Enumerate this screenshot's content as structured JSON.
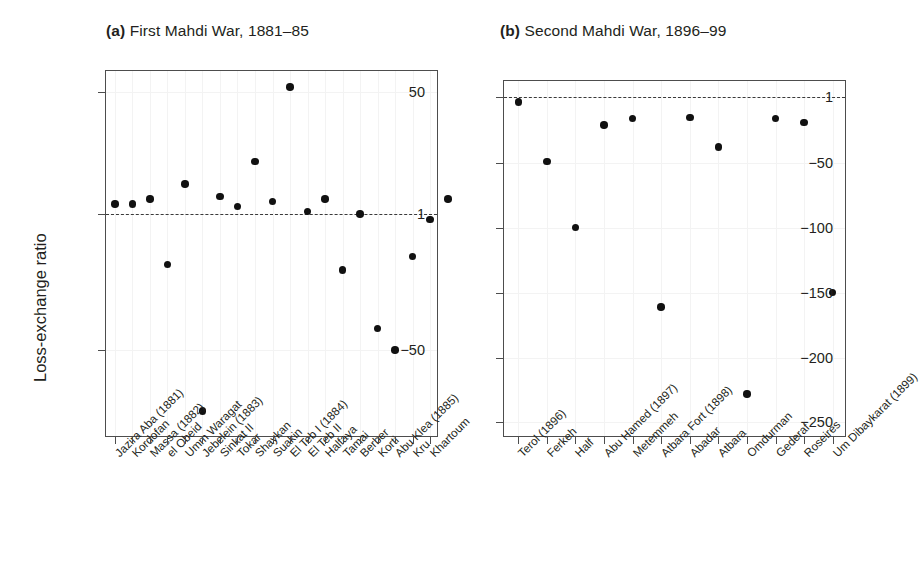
{
  "figure": {
    "y_axis_title": "Loss-exchange ratio",
    "background_color": "#ffffff",
    "point_color": "#111111",
    "axis_color": "#4d4d4d",
    "refline_color": "#3a3a3a"
  },
  "panels": {
    "a": {
      "tag": "(a)",
      "title": "First Mahdi War, 1881–85"
    },
    "b": {
      "tag": "(b)",
      "title": "Second Mahdi War, 1896–99"
    }
  },
  "chart_data": [
    {
      "type": "scatter",
      "panel": "a",
      "title": "(a) First Mahdi War, 1881–85",
      "xlabel": "",
      "ylabel": "Loss-exchange ratio",
      "ytick_labels": [
        "50",
        "1",
        "−50"
      ],
      "ytick_values": [
        50,
        1,
        -50
      ],
      "ylim": [
        -115,
        62
      ],
      "grid": true,
      "legend": "none",
      "reference_line": {
        "value": 1,
        "style": "dashed",
        "label": "1"
      },
      "categories": [
        "Jazira Aba (1881)",
        "Kordofan",
        "Massa (1882)",
        "el Obeid",
        "Umm Waragat",
        "Jebelein (1883)",
        "Sinkat II",
        "Tokar",
        "Shaykan",
        "Suakin",
        "El Teb I (1884)",
        "El Teb II",
        "Halfaya",
        "Tamai",
        "Berber",
        "Korti",
        "Abu Klea (1885)",
        "Kru",
        "Khartoum"
      ],
      "values": [
        5,
        5,
        7,
        -18,
        13,
        -95,
        8,
        4,
        22,
        6,
        53,
        2,
        7,
        -20,
        1,
        -42,
        -50,
        -15,
        -1,
        7
      ],
      "points": [
        {
          "category": "Jazira Aba (1881)",
          "value": 5
        },
        {
          "category": "Kordofan",
          "value": 5
        },
        {
          "category": "Massa (1882)",
          "value": 7
        },
        {
          "category": "el Obeid",
          "value": -18
        },
        {
          "category": "Umm Waragat",
          "value": 13
        },
        {
          "category": "Jebelein (1883)",
          "value": -95
        },
        {
          "category": "Sinkat II",
          "value": 8
        },
        {
          "category": "Tokar",
          "value": 4
        },
        {
          "category": "Shaykan",
          "value": 22
        },
        {
          "category": "Suakin",
          "value": 6
        },
        {
          "category": "El Teb I (1884)",
          "value": 53
        },
        {
          "category": "El Teb II",
          "value": 2
        },
        {
          "category": "Halfaya",
          "value": 7
        },
        {
          "category": "Tamai",
          "value": -20
        },
        {
          "category": "Berber",
          "value": 1
        },
        {
          "category": "Korti",
          "value": -42
        },
        {
          "category": "Abu Klea (1885)",
          "value": -50
        },
        {
          "category": "Kru",
          "value": -15
        },
        {
          "category": "Khartoum",
          "value": -1
        },
        {
          "category": "Khartoum",
          "value": 7
        }
      ]
    },
    {
      "type": "scatter",
      "panel": "b",
      "title": "(b) Second Mahdi War, 1896–99",
      "xlabel": "",
      "ylabel": "Loss-exchange ratio",
      "ytick_labels": [
        "1",
        "−50",
        "−100",
        "−150",
        "−200",
        "−250"
      ],
      "ytick_values": [
        1,
        -50,
        -100,
        -150,
        -200,
        -250
      ],
      "ylim": [
        -262,
        13
      ],
      "grid": true,
      "legend": "none",
      "reference_line": {
        "value": 1,
        "style": "dashed",
        "label": "1"
      },
      "categories": [
        "Terol (1896)",
        "Ferkeh",
        "Half",
        "Abu Hamed (1897)",
        "Metemmeh",
        "Atbara Fort (1898)",
        "Abadar",
        "Atbara",
        "Omdurman",
        "Gederaf",
        "Roseires",
        "Um Dibaykarat (1899)"
      ],
      "values": [
        -3,
        -49,
        -100,
        -21,
        -16,
        -161,
        -15,
        -38,
        -228,
        -16,
        -19,
        -150
      ],
      "points": [
        {
          "category": "Terol (1896)",
          "value": -3
        },
        {
          "category": "Ferkeh",
          "value": -49
        },
        {
          "category": "Half",
          "value": -100
        },
        {
          "category": "Abu Hamed (1897)",
          "value": -21
        },
        {
          "category": "Metemmeh",
          "value": -16
        },
        {
          "category": "Atbara Fort (1898)",
          "value": -161
        },
        {
          "category": "Abadar",
          "value": -15
        },
        {
          "category": "Atbara",
          "value": -38
        },
        {
          "category": "Omdurman",
          "value": -228
        },
        {
          "category": "Gederaf",
          "value": -16
        },
        {
          "category": "Roseires",
          "value": -19
        },
        {
          "category": "Um Dibaykarat (1899)",
          "value": -150
        }
      ]
    }
  ]
}
